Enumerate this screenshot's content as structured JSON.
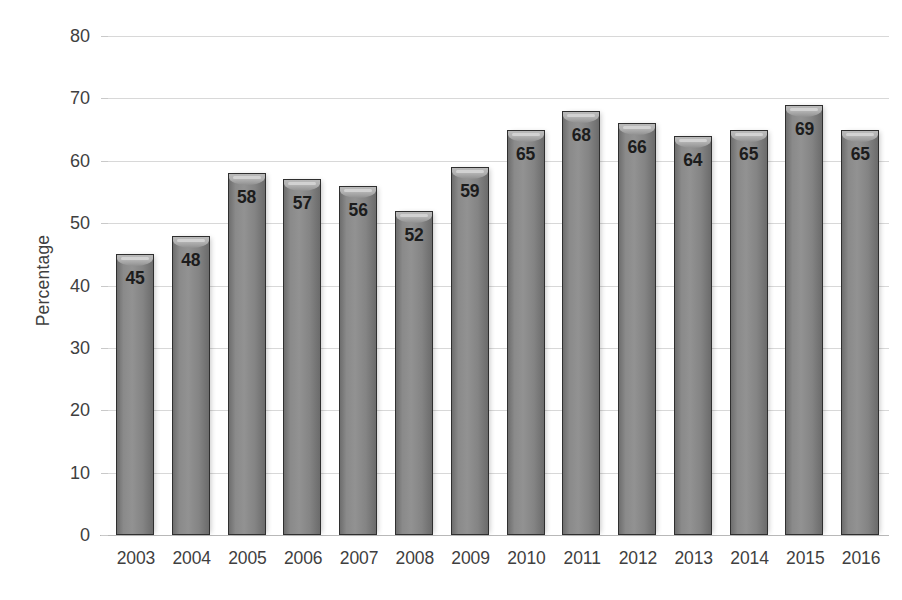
{
  "chart_data": {
    "type": "bar",
    "title": "",
    "subtitle": "",
    "xlabel": "",
    "ylabel": "Percentage",
    "categories": [
      "2003",
      "2004",
      "2005",
      "2006",
      "2007",
      "2008",
      "2009",
      "2010",
      "2011",
      "2012",
      "2013",
      "2014",
      "2015",
      "2016"
    ],
    "values": [
      45,
      48,
      58,
      57,
      56,
      52,
      59,
      65,
      68,
      66,
      64,
      65,
      69,
      65
    ],
    "data_labels": [
      "45",
      "48",
      "58",
      "57",
      "56",
      "52",
      "59",
      "65",
      "68",
      "66",
      "64",
      "65",
      "69",
      "65"
    ],
    "ylim": [
      0,
      80
    ],
    "ytick_step": 10,
    "ytick_labels": [
      "80",
      "70",
      "60",
      "50",
      "40",
      "30",
      "20",
      "10",
      "0"
    ],
    "ytick_values": [
      80,
      70,
      60,
      50,
      40,
      30,
      20,
      10,
      0
    ],
    "grid": true,
    "grid_axis": "y",
    "legend": false,
    "legend_position": "none",
    "annotations": [],
    "colors": {
      "bar_fill": "#8a8a8a",
      "bar_fill_light": "#929292",
      "bar_border": "#2f2f2f",
      "bar_cap": "#b3b3b3",
      "gridline": "#d6d6d6",
      "baseline": "#b4b4b4",
      "text": "#3f3f3f",
      "value_label": "#1c1c1c",
      "background": "#ffffff"
    }
  }
}
